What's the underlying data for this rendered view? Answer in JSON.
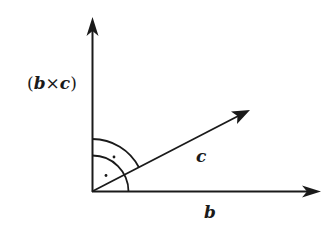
{
  "diagram": {
    "labels": {
      "cross_product": "(b×c)",
      "cross_open": "(",
      "cross_b": "b",
      "cross_times": "×",
      "cross_c": "c",
      "cross_close": ")",
      "vector_c": "c",
      "vector_b": "b"
    },
    "vectors": [
      {
        "name": "b×c",
        "from": [
          92,
          191
        ],
        "to": [
          92,
          18
        ]
      },
      {
        "name": "b",
        "from": [
          92,
          191
        ],
        "to": [
          320,
          191
        ]
      },
      {
        "name": "c",
        "from": [
          92,
          191
        ],
        "to": [
          250,
          110
        ]
      }
    ],
    "right_angle_markers": [
      {
        "between": [
          "b×c",
          "c"
        ],
        "radius": 52,
        "dot": true
      },
      {
        "between": [
          "c",
          "b"
        ],
        "radius": 36,
        "dot": true
      }
    ],
    "colors": {
      "stroke": "#1a1a1a",
      "background": "#ffffff"
    }
  }
}
